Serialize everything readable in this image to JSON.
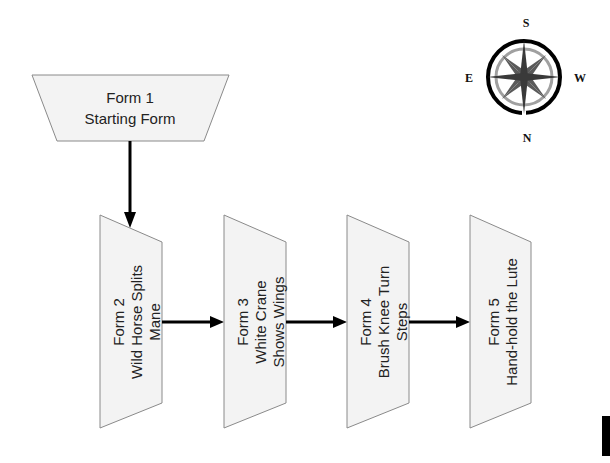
{
  "diagram": {
    "type": "flowchart",
    "nodes": [
      {
        "id": "form1",
        "line1": "Form 1",
        "line2": "Starting Form",
        "line3": ""
      },
      {
        "id": "form2",
        "line1": "Form 2",
        "line2": "Wild Horse Splits",
        "line3": "Mane"
      },
      {
        "id": "form3",
        "line1": "Form 3",
        "line2": "White Crane",
        "line3": "Shows Wings"
      },
      {
        "id": "form4",
        "line1": "Form 4",
        "line2": "Brush Knee Turn",
        "line3": "Steps"
      },
      {
        "id": "form5",
        "line1": "Form 5",
        "line2": "Hand-hold the Lute",
        "line3": ""
      }
    ],
    "edges": [
      {
        "from": "form1",
        "to": "form2"
      },
      {
        "from": "form2",
        "to": "form3"
      },
      {
        "from": "form3",
        "to": "form4"
      },
      {
        "from": "form4",
        "to": "form5"
      }
    ],
    "colors": {
      "shape_fill": "#f3f3f3",
      "shape_stroke": "#8a8a8a",
      "arrow": "#000000"
    }
  },
  "compass": {
    "top": "S",
    "bottom": "N",
    "left": "E",
    "right": "W"
  }
}
